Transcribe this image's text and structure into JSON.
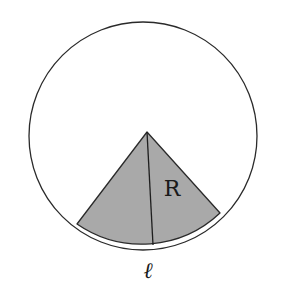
{
  "diagram": {
    "labels": {
      "radius": "R",
      "arc": "ℓ"
    },
    "colors": {
      "stroke": "#2a2a2a",
      "sector_fill": "#a9a9a9",
      "background": "#ffffff"
    }
  }
}
